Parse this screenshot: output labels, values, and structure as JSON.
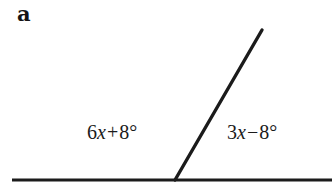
{
  "figure": {
    "part_label": "a",
    "background_color": "#ffffff",
    "stroke_color": "#1b1b1b",
    "width": 332,
    "height": 191
  },
  "diagram": {
    "type": "linear-pair-angle-diagram",
    "baseline": {
      "name": "horizontal-line",
      "x1": 12,
      "y1": 180,
      "x2": 332,
      "y2": 180,
      "stroke_width": 3.2
    },
    "ray": {
      "name": "slanted-ray",
      "x1": 175,
      "y1": 180,
      "x2": 262,
      "y2": 30,
      "stroke_width": 3.4
    },
    "vertex": {
      "x": 175,
      "y": 180
    }
  },
  "labels": {
    "left_angle": {
      "coefficient": "6",
      "variable": "x",
      "operator": "+",
      "constant": "8",
      "degree": "°",
      "full_text": "6x + 8°"
    },
    "right_angle": {
      "coefficient": "3",
      "variable": "x",
      "operator": "−",
      "constant": "8",
      "degree": "°",
      "full_text": "3x − 8°"
    }
  }
}
